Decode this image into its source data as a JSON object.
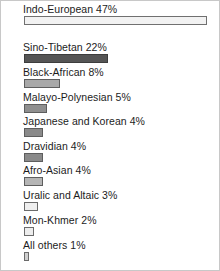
{
  "chart_data": {
    "type": "bar",
    "orientation": "horizontal",
    "title": "",
    "subtitle": "",
    "xlabel": "",
    "ylabel": "",
    "xlim": [
      0,
      47
    ],
    "grid": false,
    "legend": false,
    "value_suffix": "%",
    "categories": [
      "Indo-European",
      "Sino-Tibetan",
      "Black-African",
      "Malayo-Polynesian",
      "Japanese and Korean",
      "Dravidian",
      "Afro-Asian",
      "Uralic and Altaic",
      "Mon-Khmer",
      "All others"
    ],
    "values": [
      47,
      22,
      8,
      5,
      4,
      4,
      4,
      3,
      2,
      1
    ],
    "bars": [
      {
        "label": "Indo-European 47%",
        "name": "Indo-European",
        "value": 47,
        "bar_width_px": 183,
        "fill": "#f2f2f2",
        "stroke": "#707070"
      },
      {
        "label": "Sino-Tibetan 22%",
        "name": "Sino-Tibetan",
        "value": 22,
        "bar_width_px": 84,
        "fill": "#555555",
        "stroke": "#3d3d3d"
      },
      {
        "label": "Black-African 8%",
        "name": "Black-African",
        "value": 8,
        "bar_width_px": 36,
        "fill": "#a8a8a8",
        "stroke": "#5e5e5e"
      },
      {
        "label": "Malayo-Polynesian 5%",
        "name": "Malayo-Polynesian",
        "value": 5,
        "bar_width_px": 23,
        "fill": "#8f8f8f",
        "stroke": "#5e5e5e"
      },
      {
        "label": "Japanese and Korean 4%",
        "name": "Japanese and Korean",
        "value": 4,
        "bar_width_px": 19,
        "fill": "#8a8a8a",
        "stroke": "#5e5e5e"
      },
      {
        "label": "Dravidian 4%",
        "name": "Dravidian",
        "value": 4,
        "bar_width_px": 19,
        "fill": "#8a8a8a",
        "stroke": "#5e5e5e"
      },
      {
        "label": "Afro-Asian 4%",
        "name": "Afro-Asian",
        "value": 4,
        "bar_width_px": 19,
        "fill": "#b5b5b5",
        "stroke": "#5e5e5e"
      },
      {
        "label": "Uralic and Altaic 3%",
        "name": "Uralic and Altaic",
        "value": 3,
        "bar_width_px": 14,
        "fill": "#efefef",
        "stroke": "#6b6b6b"
      },
      {
        "label": "Mon-Khmer 2%",
        "name": "Mon-Khmer",
        "value": 2,
        "bar_width_px": 10,
        "fill": "#ededed",
        "stroke": "#6b6b6b"
      },
      {
        "label": "All others 1%",
        "name": "All others",
        "value": 1,
        "bar_width_px": 5,
        "fill": "#d0d0d0",
        "stroke": "#6b6b6b"
      }
    ]
  }
}
